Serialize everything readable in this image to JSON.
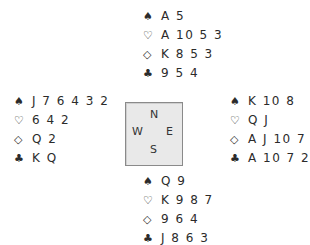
{
  "diagram": {
    "type": "bridge-deal",
    "suit_symbols": {
      "spades": "♠",
      "hearts": "♡",
      "diamonds": "◇",
      "clubs": "♣"
    },
    "compass": {
      "north": "N",
      "west": "W",
      "east": "E",
      "south": "S"
    },
    "hands": {
      "north": {
        "spades": "A 5",
        "hearts": "A 10 5 3",
        "diamonds": "K 8 5 3",
        "clubs": "9 5 4"
      },
      "west": {
        "spades": "J 7 6 4 3 2",
        "hearts": "6 4 2",
        "diamonds": "Q 2",
        "clubs": "K Q"
      },
      "east": {
        "spades": "K 10 8",
        "hearts": "Q J",
        "diamonds": "A J 10 7",
        "clubs": "A 10 7 2"
      },
      "south": {
        "spades": "Q 9",
        "hearts": "K 9 8 7",
        "diamonds": "9 6 4",
        "clubs": "J 8 6 3"
      }
    }
  }
}
